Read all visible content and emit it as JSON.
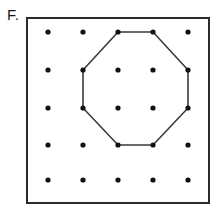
{
  "figure": {
    "label": "F.",
    "caption_text": "F.",
    "kind": "geoboard-dot-grid-figure"
  },
  "board": {
    "frame": {
      "x": 26,
      "y": 17,
      "width": 184,
      "height": 187,
      "stroke_color": "#2b2b2b",
      "fill_color": "#ffffff",
      "stroke_width": 2
    },
    "grid": {
      "rows": 5,
      "columns": 5,
      "dot_count": 25,
      "dot_radius": 2.6,
      "dot_color": "#111111",
      "column_x": [
        48,
        83,
        118,
        153,
        188
      ],
      "row_y": [
        32,
        70,
        108,
        145,
        180
      ]
    }
  },
  "shape": {
    "name": "octagon",
    "sides": 8,
    "stroke_color": "#3a3a3a",
    "stroke_width": 1.6,
    "fill": "none",
    "vertex_labels": [
      "r1c3",
      "r1c4",
      "r2c5",
      "r3c5",
      "r4c4",
      "r4c3",
      "r3c2",
      "r2c2"
    ],
    "vertices": [
      {
        "row": 1,
        "col": 3,
        "x": 118,
        "y": 32
      },
      {
        "row": 1,
        "col": 4,
        "x": 153,
        "y": 32
      },
      {
        "row": 2,
        "col": 5,
        "x": 188,
        "y": 70
      },
      {
        "row": 3,
        "col": 5,
        "x": 188,
        "y": 108
      },
      {
        "row": 4,
        "col": 4,
        "x": 153,
        "y": 145
      },
      {
        "row": 4,
        "col": 3,
        "x": 118,
        "y": 145
      },
      {
        "row": 3,
        "col": 2,
        "x": 83,
        "y": 108
      },
      {
        "row": 2,
        "col": 2,
        "x": 83,
        "y": 70
      }
    ]
  },
  "dots": [
    {
      "row": 1,
      "col": 1,
      "x": 48,
      "y": 32,
      "on_shape": false
    },
    {
      "row": 1,
      "col": 2,
      "x": 83,
      "y": 32,
      "on_shape": false
    },
    {
      "row": 1,
      "col": 3,
      "x": 118,
      "y": 32,
      "on_shape": true
    },
    {
      "row": 1,
      "col": 4,
      "x": 153,
      "y": 32,
      "on_shape": true
    },
    {
      "row": 1,
      "col": 5,
      "x": 188,
      "y": 32,
      "on_shape": false
    },
    {
      "row": 2,
      "col": 1,
      "x": 48,
      "y": 70,
      "on_shape": false
    },
    {
      "row": 2,
      "col": 2,
      "x": 83,
      "y": 70,
      "on_shape": true
    },
    {
      "row": 2,
      "col": 3,
      "x": 118,
      "y": 70,
      "on_shape": false
    },
    {
      "row": 2,
      "col": 4,
      "x": 153,
      "y": 70,
      "on_shape": false
    },
    {
      "row": 2,
      "col": 5,
      "x": 188,
      "y": 70,
      "on_shape": true
    },
    {
      "row": 3,
      "col": 1,
      "x": 48,
      "y": 108,
      "on_shape": false
    },
    {
      "row": 3,
      "col": 2,
      "x": 83,
      "y": 108,
      "on_shape": true
    },
    {
      "row": 3,
      "col": 3,
      "x": 118,
      "y": 108,
      "on_shape": false
    },
    {
      "row": 3,
      "col": 4,
      "x": 153,
      "y": 108,
      "on_shape": false
    },
    {
      "row": 3,
      "col": 5,
      "x": 188,
      "y": 108,
      "on_shape": true
    },
    {
      "row": 4,
      "col": 1,
      "x": 48,
      "y": 145,
      "on_shape": false
    },
    {
      "row": 4,
      "col": 2,
      "x": 83,
      "y": 145,
      "on_shape": false
    },
    {
      "row": 4,
      "col": 3,
      "x": 118,
      "y": 145,
      "on_shape": true
    },
    {
      "row": 4,
      "col": 4,
      "x": 153,
      "y": 145,
      "on_shape": true
    },
    {
      "row": 4,
      "col": 5,
      "x": 188,
      "y": 145,
      "on_shape": false
    },
    {
      "row": 5,
      "col": 1,
      "x": 48,
      "y": 180,
      "on_shape": false
    },
    {
      "row": 5,
      "col": 2,
      "x": 83,
      "y": 180,
      "on_shape": false
    },
    {
      "row": 5,
      "col": 3,
      "x": 118,
      "y": 180,
      "on_shape": false
    },
    {
      "row": 5,
      "col": 4,
      "x": 153,
      "y": 180,
      "on_shape": false
    },
    {
      "row": 5,
      "col": 5,
      "x": 188,
      "y": 180,
      "on_shape": false
    }
  ]
}
